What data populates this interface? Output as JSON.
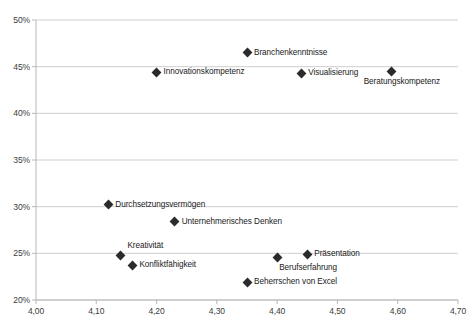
{
  "chart_data": {
    "type": "scatter",
    "title": "",
    "xlabel": "",
    "ylabel": "",
    "xlim": [
      4.0,
      4.7
    ],
    "ylim": [
      20,
      50
    ],
    "grid": true,
    "legend": "none",
    "x_ticks": [
      "4,00",
      "4,10",
      "4,20",
      "4,30",
      "4,40",
      "4,50",
      "4,60",
      "4,70"
    ],
    "x_tick_values": [
      4.0,
      4.1,
      4.2,
      4.3,
      4.4,
      4.5,
      4.6,
      4.7
    ],
    "y_ticks": [
      "20%",
      "25%",
      "30%",
      "35%",
      "40%",
      "45%",
      "50%"
    ],
    "y_tick_values": [
      20,
      25,
      30,
      35,
      40,
      45,
      50
    ],
    "points": [
      {
        "label": "Branchenkenntnisse",
        "x": 4.35,
        "y": 46.5,
        "label_side": "right"
      },
      {
        "label": "Innovationskompetenz",
        "x": 4.2,
        "y": 44.4,
        "label_side": "right"
      },
      {
        "label": "Visualisierung",
        "x": 4.44,
        "y": 44.3,
        "label_side": "right"
      },
      {
        "label": "Beratungskompetenz",
        "x": 4.59,
        "y": 44.5,
        "label_side": "below"
      },
      {
        "label": "Durchsetzungsvermögen",
        "x": 4.12,
        "y": 30.2,
        "label_side": "right"
      },
      {
        "label": "Unternehmerisches Denken",
        "x": 4.23,
        "y": 28.4,
        "label_side": "right"
      },
      {
        "label": "Kreativität",
        "x": 4.14,
        "y": 24.8,
        "label_side": "above-right"
      },
      {
        "label": "Konfliktfähigkeit",
        "x": 4.16,
        "y": 23.7,
        "label_side": "right"
      },
      {
        "label": "Berufserfahrung",
        "x": 4.4,
        "y": 24.6,
        "label_side": "below-right"
      },
      {
        "label": "Präsentation",
        "x": 4.45,
        "y": 24.9,
        "label_side": "right"
      },
      {
        "label": "Beherrschen von Excel",
        "x": 4.35,
        "y": 21.9,
        "label_side": "right"
      }
    ],
    "colors": {
      "marker": "#2b2b2b",
      "gridline": "#c9c9c9",
      "axis": "#b0b0b0",
      "text": "#1a1a1a"
    }
  }
}
